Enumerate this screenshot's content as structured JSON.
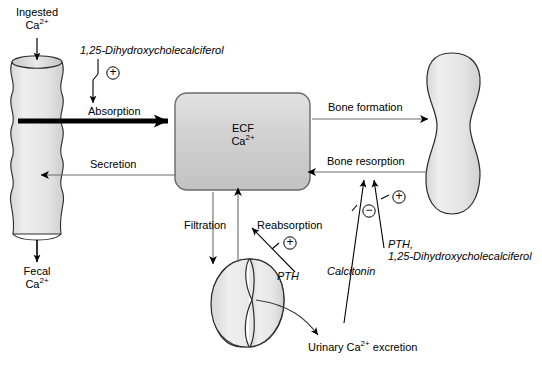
{
  "diagram": {
    "colors": {
      "organ_fill": "#e8e8e8",
      "organ_stroke": "#2b2b2b",
      "ecf_fill": "#d0d0d0",
      "ecf_stroke": "#555555",
      "arrow": "#6b6b6b",
      "bold_arrow": "#000000",
      "text": "#000000"
    },
    "organs": {
      "intestine": {
        "name": "intestine-tube",
        "label": ""
      },
      "ecf_box": {
        "name": "ecf-compartment",
        "line1": "ECF",
        "line2_text": "Ca",
        "line2_sup": "2+"
      },
      "bone": {
        "name": "bone-shape",
        "label": ""
      },
      "kidney": {
        "name": "kidney-shape",
        "label": ""
      }
    },
    "labels": {
      "ingested": {
        "line1": "Ingested",
        "line2_text": "Ca",
        "line2_sup": "2+"
      },
      "fecal": {
        "line1": "Fecal",
        "line2_text": "Ca",
        "line2_sup": "2+"
      },
      "vitamin_d_top": "1,25-Dihydroxycholecalciferol",
      "absorption": "Absorption",
      "secretion": "Secretion",
      "bone_formation": "Bone formation",
      "bone_resorption": "Bone resorption",
      "filtration": "Filtration",
      "reabsorption": "Reabsorption",
      "pth_kidney": "PTH",
      "pth_bone_line1": "PTH,",
      "pth_bone_line2": "1,25-Dihydroxycholecalciferol",
      "calcitonin": "Calcitonin",
      "urinary_text_a": "Urinary Ca",
      "urinary_sup": "2+",
      "urinary_text_b": " excretion"
    },
    "signs": {
      "absorption_plus": "+",
      "reabsorption_plus": "+",
      "resorption_plus": "+",
      "calcitonin_minus": "−"
    }
  }
}
